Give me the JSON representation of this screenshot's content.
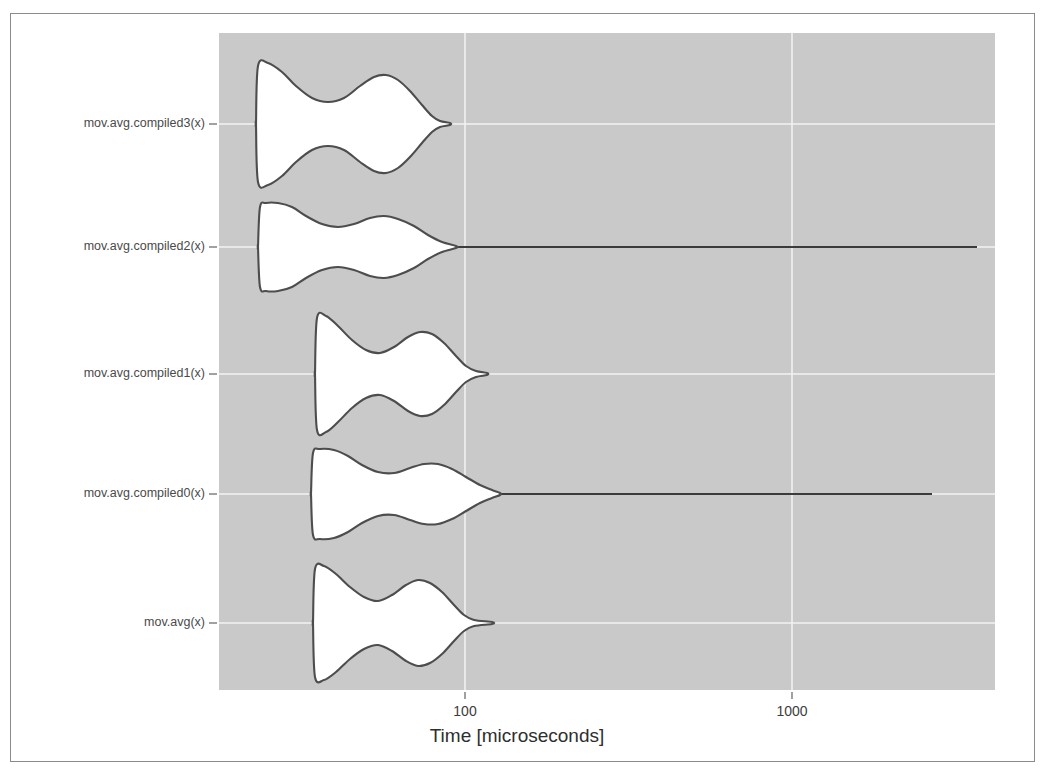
{
  "figure": {
    "background_color": "#ffffff",
    "frame_color": "#8a8a8a",
    "plot_background_color": "#c9c9c9",
    "gridline_color": "#f2f2f2",
    "violin_fill_color": "#ffffff",
    "violin_stroke_color": "#4d4d4d"
  },
  "axes": {
    "x_title": "Time [microseconds]",
    "x_scale": "log",
    "x_ticks": [
      {
        "label": "100",
        "value": 100,
        "px": 465
      },
      {
        "label": "1000",
        "value": 1000,
        "px": 792
      }
    ],
    "y_labels": [
      "mov.avg.compiled3(x)",
      "mov.avg.compiled2(x)",
      "mov.avg.compiled1(x)",
      "mov.avg.compiled0(x)",
      "mov.avg(x)"
    ],
    "plot_left_px": 219,
    "plot_right_px": 995,
    "plot_top_px": 33,
    "plot_bottom_px": 690
  },
  "chart_data": {
    "type": "violin",
    "title": "",
    "xlabel": "Time [microseconds]",
    "ylabel": "",
    "xscale": "log",
    "xlim": [
      30,
      4000
    ],
    "grid": true,
    "legend": null,
    "categories": [
      "mov.avg.compiled3(x)",
      "mov.avg.compiled2(x)",
      "mov.avg.compiled1(x)",
      "mov.avg.compiled0(x)",
      "mov.avg(x)"
    ],
    "series": [
      {
        "name": "mov.avg.compiled3(x)",
        "row_center_px": 124,
        "body_start_px": 256,
        "body_end_px": 438,
        "tail_end_px": 450,
        "half_widths_px": [
          {
            "x": 256,
            "w": 0
          },
          {
            "x": 258,
            "w": 58
          },
          {
            "x": 268,
            "w": 61
          },
          {
            "x": 282,
            "w": 52
          },
          {
            "x": 296,
            "w": 38
          },
          {
            "x": 312,
            "w": 26
          },
          {
            "x": 328,
            "w": 22
          },
          {
            "x": 344,
            "w": 26
          },
          {
            "x": 360,
            "w": 38
          },
          {
            "x": 374,
            "w": 47
          },
          {
            "x": 386,
            "w": 49
          },
          {
            "x": 398,
            "w": 44
          },
          {
            "x": 410,
            "w": 33
          },
          {
            "x": 422,
            "w": 19
          },
          {
            "x": 432,
            "w": 8
          },
          {
            "x": 440,
            "w": 3
          },
          {
            "x": 450,
            "w": 1
          }
        ]
      },
      {
        "name": "mov.avg.compiled2(x)",
        "row_center_px": 247,
        "body_start_px": 258,
        "body_end_px": 456,
        "tail_end_px": 977,
        "half_widths_px": [
          {
            "x": 258,
            "w": 0
          },
          {
            "x": 260,
            "w": 40
          },
          {
            "x": 266,
            "w": 44
          },
          {
            "x": 278,
            "w": 44
          },
          {
            "x": 292,
            "w": 40
          },
          {
            "x": 306,
            "w": 31
          },
          {
            "x": 322,
            "w": 23
          },
          {
            "x": 338,
            "w": 20
          },
          {
            "x": 354,
            "w": 23
          },
          {
            "x": 370,
            "w": 29
          },
          {
            "x": 384,
            "w": 31
          },
          {
            "x": 398,
            "w": 28
          },
          {
            "x": 414,
            "w": 21
          },
          {
            "x": 428,
            "w": 12
          },
          {
            "x": 442,
            "w": 5
          },
          {
            "x": 456,
            "w": 1
          }
        ]
      },
      {
        "name": "mov.avg.compiled1(x)",
        "row_center_px": 374,
        "body_start_px": 315,
        "body_end_px": 474,
        "tail_end_px": 487,
        "half_widths_px": [
          {
            "x": 315,
            "w": 0
          },
          {
            "x": 317,
            "w": 56
          },
          {
            "x": 326,
            "w": 58
          },
          {
            "x": 338,
            "w": 48
          },
          {
            "x": 352,
            "w": 34
          },
          {
            "x": 366,
            "w": 24
          },
          {
            "x": 380,
            "w": 21
          },
          {
            "x": 394,
            "w": 27
          },
          {
            "x": 408,
            "w": 37
          },
          {
            "x": 420,
            "w": 42
          },
          {
            "x": 432,
            "w": 40
          },
          {
            "x": 444,
            "w": 31
          },
          {
            "x": 456,
            "w": 18
          },
          {
            "x": 466,
            "w": 8
          },
          {
            "x": 476,
            "w": 3
          },
          {
            "x": 487,
            "w": 1
          }
        ]
      },
      {
        "name": "mov.avg.compiled0(x)",
        "row_center_px": 494,
        "body_start_px": 311,
        "body_end_px": 500,
        "tail_end_px": 932,
        "half_widths_px": [
          {
            "x": 311,
            "w": 0
          },
          {
            "x": 313,
            "w": 41
          },
          {
            "x": 320,
            "w": 45
          },
          {
            "x": 334,
            "w": 44
          },
          {
            "x": 348,
            "w": 38
          },
          {
            "x": 362,
            "w": 29
          },
          {
            "x": 378,
            "w": 22
          },
          {
            "x": 394,
            "w": 21
          },
          {
            "x": 410,
            "w": 26
          },
          {
            "x": 424,
            "w": 30
          },
          {
            "x": 438,
            "w": 30
          },
          {
            "x": 452,
            "w": 25
          },
          {
            "x": 466,
            "w": 17
          },
          {
            "x": 480,
            "w": 9
          },
          {
            "x": 492,
            "w": 4
          },
          {
            "x": 500,
            "w": 1
          }
        ]
      },
      {
        "name": "mov.avg(x)",
        "row_center_px": 623,
        "body_start_px": 313,
        "body_end_px": 480,
        "tail_end_px": 492,
        "half_widths_px": [
          {
            "x": 313,
            "w": 0
          },
          {
            "x": 315,
            "w": 54
          },
          {
            "x": 324,
            "w": 57
          },
          {
            "x": 336,
            "w": 49
          },
          {
            "x": 350,
            "w": 36
          },
          {
            "x": 364,
            "w": 26
          },
          {
            "x": 378,
            "w": 22
          },
          {
            "x": 392,
            "w": 28
          },
          {
            "x": 406,
            "w": 38
          },
          {
            "x": 418,
            "w": 43
          },
          {
            "x": 430,
            "w": 40
          },
          {
            "x": 442,
            "w": 31
          },
          {
            "x": 454,
            "w": 18
          },
          {
            "x": 464,
            "w": 8
          },
          {
            "x": 474,
            "w": 3
          },
          {
            "x": 492,
            "w": 1
          }
        ]
      }
    ]
  }
}
